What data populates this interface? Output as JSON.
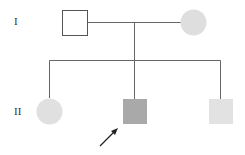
{
  "diagram": {
    "type": "pedigree",
    "generations": [
      {
        "label": "I",
        "x": 14,
        "y": 16
      },
      {
        "label": "II",
        "x": 14,
        "y": 106
      }
    ],
    "colors": {
      "line": "#666666",
      "unaffected_fill": "#ffffff",
      "female_fill": "#dedede",
      "proband_fill": "#a9a9a9",
      "sibling_fill": "#e2e2e2",
      "arrow": "#222222"
    },
    "individuals": [
      {
        "id": "I-1",
        "sex": "male",
        "status": "unaffected"
      },
      {
        "id": "I-2",
        "sex": "female",
        "status": "light-shaded"
      },
      {
        "id": "II-1",
        "sex": "female",
        "status": "light-shaded"
      },
      {
        "id": "II-2",
        "sex": "male",
        "status": "affected-proband",
        "proband": true
      },
      {
        "id": "II-3",
        "sex": "male",
        "status": "light-shaded"
      }
    ]
  }
}
